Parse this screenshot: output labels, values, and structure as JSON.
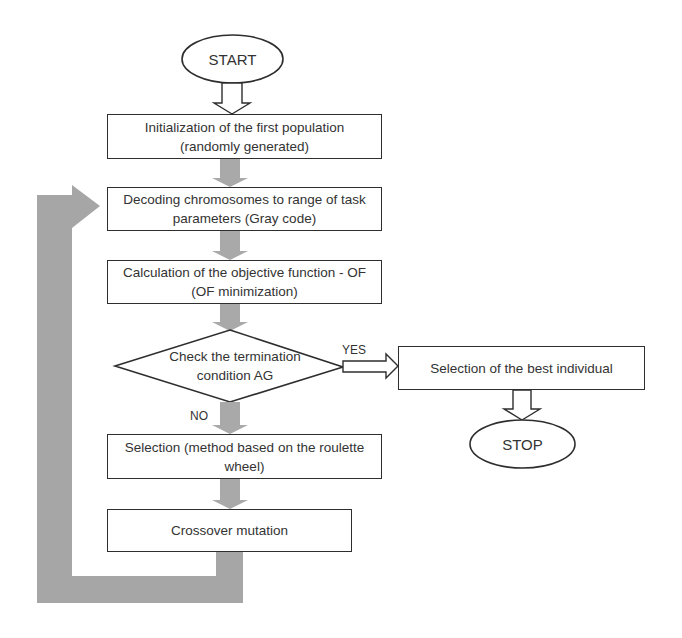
{
  "diagram": {
    "type": "flowchart",
    "colors": {
      "stroke": "#2e2e2e",
      "flow_arrow_fill": "#a9a9a9",
      "loop_arrow_fill": "#a6a6a6",
      "background": "#ffffff"
    },
    "nodes": {
      "start": {
        "shape": "ellipse",
        "label": "START"
      },
      "init": {
        "shape": "rect",
        "line1": "Initialization of  the first population",
        "line2": "(randomly generated)"
      },
      "decode": {
        "shape": "rect",
        "line1": "Decoding chromosomes to range of task",
        "line2": "parameters (Gray code)"
      },
      "calc": {
        "shape": "rect",
        "line1": "Calculation of the objective function - OF",
        "line2": "(OF minimization)"
      },
      "check": {
        "shape": "diamond",
        "line1": "Check the termination",
        "line2": "condition AG"
      },
      "selection": {
        "shape": "rect",
        "line1": "Selection (method based on the roulette",
        "line2": "wheel)"
      },
      "crossover": {
        "shape": "rect",
        "label": "Crossover mutation"
      },
      "best": {
        "shape": "rect",
        "label": "Selection of the best individual"
      },
      "stop": {
        "shape": "ellipse",
        "label": "STOP"
      }
    },
    "edges": [
      {
        "from": "start",
        "to": "init",
        "style": "outline-arrow"
      },
      {
        "from": "init",
        "to": "decode",
        "style": "gray-arrow"
      },
      {
        "from": "decode",
        "to": "calc",
        "style": "gray-arrow"
      },
      {
        "from": "calc",
        "to": "check",
        "style": "gray-arrow"
      },
      {
        "from": "check",
        "to": "best",
        "style": "outline-arrow",
        "label": "YES"
      },
      {
        "from": "check",
        "to": "selection",
        "style": "gray-arrow",
        "label": "NO"
      },
      {
        "from": "selection",
        "to": "crossover",
        "style": "gray-arrow"
      },
      {
        "from": "crossover",
        "to": "decode",
        "style": "gray-loop-arrow"
      },
      {
        "from": "best",
        "to": "stop",
        "style": "outline-arrow"
      }
    ],
    "edge_labels": {
      "yes": "YES",
      "no": "NO"
    }
  }
}
